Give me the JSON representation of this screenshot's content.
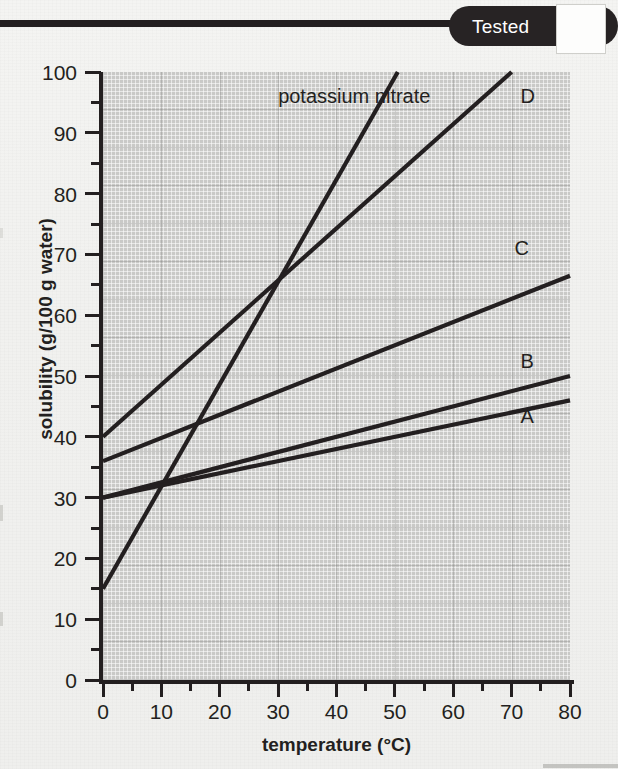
{
  "page": {
    "tab_label": "Tested"
  },
  "chart_data": {
    "type": "line",
    "title": "",
    "xlabel": "temperature (°C)",
    "ylabel": "solubility (g/100 g water)",
    "xlim": [
      0,
      80
    ],
    "ylim": [
      0,
      100
    ],
    "x_ticks": [
      0,
      10,
      20,
      30,
      40,
      50,
      60,
      70,
      80
    ],
    "y_ticks": [
      0,
      10,
      20,
      30,
      40,
      50,
      60,
      70,
      80,
      90,
      100
    ],
    "x_minor_step": 5,
    "y_minor_step": 5,
    "grid": true,
    "legend": "inline-labels",
    "series": [
      {
        "name": "potassium nitrate",
        "label": "potassium nitrate",
        "label_x": 30,
        "label_y": 96,
        "x": [
          0,
          50.5
        ],
        "values": [
          15,
          100
        ]
      },
      {
        "name": "D",
        "label": "D",
        "label_x": 71.5,
        "label_y": 96,
        "x": [
          0,
          70
        ],
        "values": [
          40,
          100
        ]
      },
      {
        "name": "C",
        "label": "C",
        "label_x": 70.5,
        "label_y": 71,
        "x": [
          0,
          80
        ],
        "values": [
          36,
          66.5
        ]
      },
      {
        "name": "B",
        "label": "B",
        "label_x": 71.5,
        "label_y": 52.5,
        "x": [
          0,
          80
        ],
        "values": [
          30,
          50
        ]
      },
      {
        "name": "A",
        "label": "A",
        "label_x": 71.5,
        "label_y": 43.5,
        "x": [
          0,
          80
        ],
        "values": [
          30,
          46
        ]
      }
    ],
    "colors": {
      "line": "#231f20",
      "plot_background": "#c9c9c7",
      "axis": "#231f20",
      "page_background": "#f2f2f0",
      "tab_background": "#272324",
      "tab_text": "#ffffff"
    }
  }
}
